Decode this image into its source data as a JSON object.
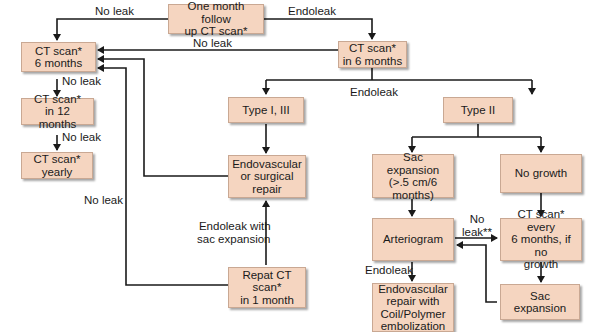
{
  "nodes": {
    "one_month": "One month follow\nup CT scan*",
    "ct_6mo_left": "CT scan*\n6 months",
    "ct_in_6mo": "CT scan*\nin 6 months",
    "ct_12mo": "CT scan*\nin 12 months",
    "ct_yearly": "CT scan*\nyearly",
    "type_1_3": "Type I, III",
    "type_2": "Type II",
    "endo_surgical": "Endovascular\nor surgical\nrepair",
    "repeat_ct": "Repat CT\nscan*\nin 1 month",
    "sac_expansion_gt": "Sac expansion\n(>.5 cm/6\nmonths)",
    "no_growth": "No growth",
    "arteriogram": "Arteriogram",
    "ct_every_6": "CT scan* every\n6 months, if no\ngrowth",
    "endo_coil": "Endovascular\nrepair with\nCoil/Polymer\nembolization",
    "sac_expansion": "Sac\nexpansion"
  },
  "edge_labels": {
    "no_leak_top": "No leak",
    "endoleak_top": "Endoleak",
    "no_leak_mid": "No leak",
    "no_leak_6_12": "No leak",
    "no_leak_12_yearly": "No leak",
    "endoleak_mid": "Endoleak",
    "no_leak_left": "No leak",
    "endoleak_sac": "Endoleak with\nsac expansion",
    "no_leak_star": "No\nleak**",
    "endoleak_art": "Endoleak"
  },
  "colors": {
    "box_fill": "#f5d5c0",
    "box_border": "#c9a893",
    "line": "#1a1a1a"
  }
}
